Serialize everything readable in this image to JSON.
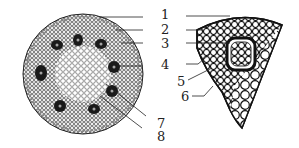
{
  "figure": {
    "labels": [
      {
        "id": "1",
        "text": "1"
      },
      {
        "id": "2",
        "text": "2"
      },
      {
        "id": "3",
        "text": "3"
      },
      {
        "id": "4",
        "text": "4"
      },
      {
        "id": "5",
        "text": "5"
      },
      {
        "id": "6",
        "text": "6"
      },
      {
        "id": "7",
        "text": "7"
      },
      {
        "id": "8",
        "text": "8"
      }
    ],
    "colors": {
      "ink": "#222222",
      "background": "#ffffff",
      "bundle": "#1a1a1a"
    }
  }
}
